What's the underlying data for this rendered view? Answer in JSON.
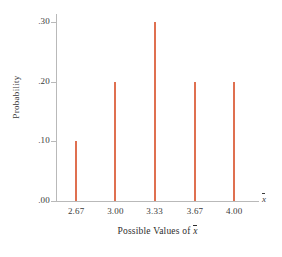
{
  "chart_data": {
    "type": "bar",
    "title": "",
    "subtitle": "",
    "xlabel": "Possible Values of x̄",
    "ylabel": "Probability",
    "categories": [
      "2.67",
      "3.00",
      "3.33",
      "3.67",
      "4.00"
    ],
    "values": [
      0.1,
      0.2,
      0.3,
      0.2,
      0.2
    ],
    "value_labels": [
      ".10",
      ".20",
      ".30",
      ".20",
      ".20"
    ],
    "x": [
      2.67,
      3.0,
      3.33,
      3.67,
      4.0
    ],
    "xlim": [
      2.5,
      4.2
    ],
    "ylim": [
      0.0,
      0.32
    ],
    "ytick_labels": [
      ".00",
      ".10",
      ".20",
      ".30"
    ],
    "ytick_values": [
      0.0,
      0.1,
      0.2,
      0.3
    ],
    "xtick_labels": [
      "2.67",
      "3.00",
      "3.33",
      "3.67",
      "4.00"
    ],
    "grid": false,
    "legend": null,
    "bar_color": "#df7050",
    "axis_color": "#b9b9b9",
    "text_color": "#3a3a3a",
    "axis_end_symbol": "x̄",
    "annotations": []
  },
  "axis_titles": {
    "x": "Possible Values of ",
    "x_symbol": "x",
    "y": "Probability"
  }
}
